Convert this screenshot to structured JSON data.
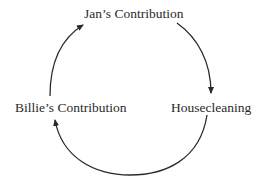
{
  "diagram": {
    "type": "cycle",
    "nodes": [
      {
        "id": "jan",
        "label": "Jan’s Contribution",
        "position": "top"
      },
      {
        "id": "house",
        "label": "Housecleaning",
        "position": "right"
      },
      {
        "id": "billie",
        "label": "Billie’s Contribution",
        "position": "left"
      }
    ],
    "edges": [
      {
        "from": "jan",
        "to": "house",
        "direction": "clockwise"
      },
      {
        "from": "house",
        "to": "billie",
        "direction": "clockwise"
      },
      {
        "from": "billie",
        "to": "jan",
        "direction": "clockwise"
      }
    ],
    "colors": {
      "background": "#ffffff",
      "stroke": "#2a2a2a",
      "text": "#2a2a2a"
    }
  }
}
